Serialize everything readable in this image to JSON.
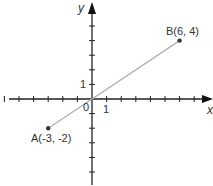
{
  "diagram": {
    "type": "coordinate-plane",
    "axes": {
      "x_label": "x",
      "y_label": "y",
      "origin_label": "0",
      "x_unit_label": "1",
      "y_unit_label": "1",
      "x_ticks": [
        -6,
        -5,
        -4,
        -3,
        -2,
        -1,
        1,
        2,
        3,
        4,
        5,
        6,
        7
      ],
      "y_ticks": [
        -6,
        -5,
        -4,
        -3,
        -2,
        -1,
        1,
        2,
        3,
        4,
        5
      ]
    },
    "points": [
      {
        "name": "A",
        "x": -3,
        "y": -2,
        "label": "A(-3, -2)"
      },
      {
        "name": "B",
        "x": 6,
        "y": 4,
        "label": "B(6, 4)"
      }
    ],
    "segment": {
      "from": "A",
      "to": "B"
    },
    "colors": {
      "axis": "#222222",
      "segment": "#b0b0b0",
      "point": "#333333",
      "text": "#333333"
    }
  }
}
